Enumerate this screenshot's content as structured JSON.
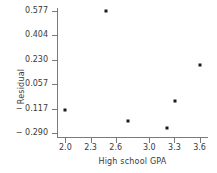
{
  "chart_data": {
    "type": "scatter",
    "title": "",
    "xlabel": "High school GPA",
    "ylabel": "Residual",
    "xlim": [
      1.9,
      3.7
    ],
    "ylim": [
      -0.32,
      0.6
    ],
    "grid": false,
    "legend": null,
    "x_ticks": [
      {
        "value": 2.0,
        "label": "2.0"
      },
      {
        "value": 2.3,
        "label": "2.3"
      },
      {
        "value": 2.6,
        "label": "2.6"
      },
      {
        "value": 3.0,
        "label": "3.0"
      },
      {
        "value": 3.3,
        "label": "3.3"
      },
      {
        "value": 3.6,
        "label": "3.6"
      }
    ],
    "y_ticks": [
      {
        "value": 0.577,
        "label": "0.577"
      },
      {
        "value": 0.404,
        "label": "0.404"
      },
      {
        "value": 0.23,
        "label": "0.230"
      },
      {
        "value": 0.057,
        "label": "0.057"
      },
      {
        "value": -0.117,
        "label": "− 0.117"
      },
      {
        "value": -0.29,
        "label": "− 0.290"
      }
    ],
    "points": [
      {
        "x": 2.0,
        "y": -0.128
      },
      {
        "x": 2.49,
        "y": 0.577
      },
      {
        "x": 2.75,
        "y": -0.209
      },
      {
        "x": 3.21,
        "y": -0.256
      },
      {
        "x": 3.31,
        "y": -0.061
      },
      {
        "x": 3.6,
        "y": 0.194
      }
    ],
    "marker_color": "#1a1a1a",
    "axis_color": "#7a7a7a",
    "text_color": "#3a3a3a"
  }
}
